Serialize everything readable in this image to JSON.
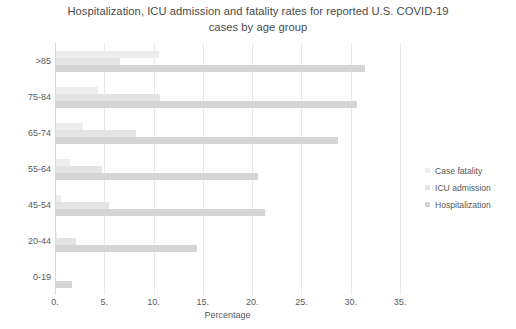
{
  "chart_data": {
    "type": "bar",
    "orientation": "horizontal",
    "title": "Hospitalization, ICU admission and fatality rates for reported U.S. COVID-19 cases by age group",
    "xlabel": "Percentage",
    "ylabel": "",
    "xlim": [
      0,
      35
    ],
    "xticks": [
      "0.",
      "5.",
      "10.",
      "15.",
      "20.",
      "25.",
      "30.",
      "35."
    ],
    "xtick_values": [
      0,
      5,
      10,
      15,
      20,
      25,
      30,
      35
    ],
    "grid": true,
    "legend_position": "right",
    "categories": [
      "0-19",
      "20-44",
      "45-54",
      "55-64",
      "65-74",
      "75-84",
      ">85"
    ],
    "categories_display_order": [
      ">85",
      "75-84",
      "65-74",
      "55-64",
      "45-54",
      "20-44",
      "0-19"
    ],
    "series": [
      {
        "name": "Case fatality",
        "color": "#ededed",
        "values": [
          0.0,
          0.1,
          0.5,
          1.4,
          2.7,
          4.3,
          10.4
        ]
      },
      {
        "name": "ICU admission",
        "color": "#e4e4e4",
        "values": [
          0.0,
          2.0,
          5.4,
          4.7,
          8.1,
          10.5,
          6.5
        ]
      },
      {
        "name": "Hospitalization",
        "color": "#d5d5d5",
        "values": [
          1.6,
          14.3,
          21.2,
          20.5,
          28.6,
          30.5,
          31.3
        ]
      }
    ]
  },
  "colors": {
    "background": "#ffffff",
    "gridline": "#e8e8e8",
    "axis": "#d9d9d9",
    "text": "#5a5a5a",
    "title_text": "#4a4a4a"
  }
}
